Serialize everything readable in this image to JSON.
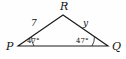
{
  "figure": {
    "type": "triangle-diagram",
    "background_color": "#fefefe",
    "stroke_color": "#1a1a1a",
    "vertices": [
      {
        "id": "P",
        "label": "P",
        "x": 18,
        "y": 46,
        "label_x": 6,
        "label_y": 50
      },
      {
        "id": "R",
        "label": "R",
        "x": 63,
        "y": 15,
        "label_x": 60,
        "label_y": 10
      },
      {
        "id": "Q",
        "label": "Q",
        "x": 108,
        "y": 46,
        "label_x": 112,
        "label_y": 50
      }
    ],
    "sides": [
      {
        "id": "PR",
        "label": "7",
        "label_x": 31,
        "label_y": 26
      },
      {
        "id": "RQ",
        "label": "y",
        "label_x": 83,
        "label_y": 26
      },
      {
        "id": "PQ",
        "label": "",
        "label_x": 0,
        "label_y": 0
      }
    ],
    "angles": [
      {
        "id": "angle-P",
        "vertex": "P",
        "label": "47°",
        "label_x": 27,
        "label_y": 43
      },
      {
        "id": "angle-Q",
        "vertex": "Q",
        "label": "47°",
        "label_x": 76,
        "label_y": 43
      }
    ]
  }
}
